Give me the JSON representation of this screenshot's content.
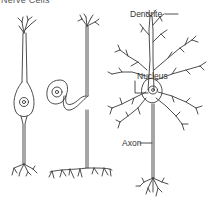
{
  "figure": {
    "title": "Nerve Cells",
    "labels": {
      "dendrite": "Dendrite",
      "nucleus": "Nucleus",
      "axon": "Axon"
    },
    "neurons": [
      {
        "name": "bipolar neuron",
        "position": "left"
      },
      {
        "name": "unipolar neuron",
        "position": "middle"
      },
      {
        "name": "multipolar neuron",
        "position": "right"
      }
    ],
    "colors": {
      "line": "#3a3a3a",
      "text": "#333333",
      "background": "#ffffff"
    }
  }
}
